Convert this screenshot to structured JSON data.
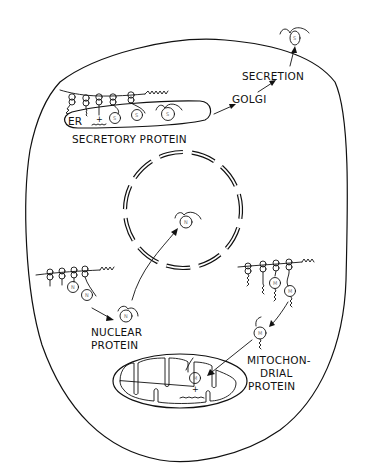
{
  "diagram": {
    "type": "protein-targeting-cell-schematic",
    "labels": {
      "er": "ER",
      "secretory_protein": "SECRETORY PROTEIN",
      "golgi": "GOLGI",
      "secretion": "SECRETION",
      "nuclear_line1": "NUCLEAR",
      "nuclear_line2": "PROTEIN",
      "mito_line1": "MITOCHON-",
      "mito_line2": "DRIAL",
      "mito_line3": "PROTEIN"
    },
    "protein_markers": {
      "secretory": "S",
      "nuclear": "N",
      "mitochondrial": "M"
    },
    "charge_symbol": "+",
    "nodes": [
      {
        "id": "cell",
        "kind": "cell-membrane"
      },
      {
        "id": "er",
        "kind": "endoplasmic-reticulum",
        "label": "ER"
      },
      {
        "id": "nucleus",
        "kind": "nuclear-envelope"
      },
      {
        "id": "mitochondrion",
        "kind": "organelle"
      },
      {
        "id": "golgi",
        "kind": "stage",
        "label": "GOLGI"
      },
      {
        "id": "secretion",
        "kind": "stage",
        "label": "SECRETION"
      }
    ],
    "edges": [
      {
        "from": "er",
        "to": "golgi"
      },
      {
        "from": "golgi",
        "to": "secretion"
      },
      {
        "from": "secretion",
        "to": "outside-cell"
      },
      {
        "from": "cytosolic-polysome",
        "to": "nuclear-protein"
      },
      {
        "from": "nuclear-protein",
        "to": "nucleus"
      },
      {
        "from": "cytosolic-polysome-2",
        "to": "mitochondrial-protein"
      },
      {
        "from": "mitochondrial-protein",
        "to": "mitochondrion"
      }
    ]
  }
}
